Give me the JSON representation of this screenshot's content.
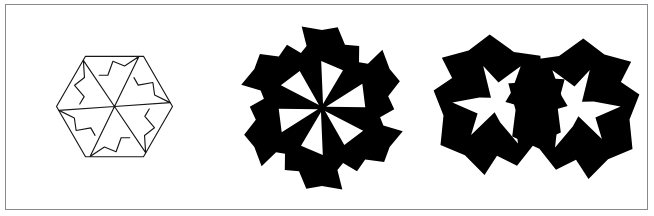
{
  "plate": {
    "width": 654,
    "height": 216,
    "background_color": "#ffffff",
    "border_color": "#8a8a8e",
    "ink_color": "#000000",
    "outline_color": "#171717",
    "frame": {
      "x": 5,
      "y": 4,
      "width": 643,
      "height": 206
    }
  },
  "figures": [
    {
      "id": "figure-1",
      "name": "hexagon-pinwheel-outline",
      "style": "outline",
      "symmetry_order": 6,
      "center": {
        "x": 114.5,
        "y": 106.5
      },
      "radius": 58,
      "rotation_deg": 0,
      "description": "Regular hexagon with an inscribed six-fold pinwheel drawn in thin black outline on white",
      "hexagon_vertices": [
        {
          "x": 172.5,
          "y": 106.5
        },
        {
          "x": 143.5,
          "y": 156.7
        },
        {
          "x": 85.5,
          "y": 156.7
        },
        {
          "x": 56.5,
          "y": 106.5
        },
        {
          "x": 85.5,
          "y": 56.3
        },
        {
          "x": 143.5,
          "y": 56.3
        }
      ],
      "blade_profile": [
        {
          "r": 0.0,
          "a": 0.0
        },
        {
          "r": 0.96,
          "a": 56.0
        },
        {
          "r": 0.72,
          "a": 44.0
        },
        {
          "r": 0.78,
          "a": 28.0
        },
        {
          "r": 0.55,
          "a": 18.0
        },
        {
          "r": 0.6,
          "a": 4.0
        }
      ]
    },
    {
      "id": "figure-2",
      "name": "six-blade-solid-pinwheel",
      "style": "solid",
      "symmetry_order": 6,
      "center": {
        "x": 322.0,
        "y": 108.0
      },
      "radius": 84,
      "rotation_deg": 14,
      "description": "Six-fold solid black pinwheel rosette with white triangular wedges radiating from the centre",
      "outer_profile": [
        {
          "r": 1.0,
          "a": 2.0
        },
        {
          "r": 0.93,
          "a": 16.0
        },
        {
          "r": 0.98,
          "a": 27.0
        },
        {
          "r": 0.8,
          "a": 36.0
        },
        {
          "r": 0.86,
          "a": 47.0
        },
        {
          "r": 0.7,
          "a": 55.0
        },
        {
          "r": 0.76,
          "a": 62.0
        }
      ],
      "wedge_half_angle_deg": 15,
      "wedge_inner_radius": 0.05,
      "wedge_outer_radius": 0.56
    },
    {
      "id": "figure-3-left",
      "name": "three-blade-solid-pinwheel-left",
      "style": "solid",
      "symmetry_order": 3,
      "center": {
        "x": 497.0,
        "y": 104.0
      },
      "radius": 72,
      "rotation_deg": 96,
      "mirrored": false,
      "description": "Three-fold solid black pinwheel with a white star-shaped void at its core",
      "outer_profile": [
        {
          "r": 1.0,
          "a": 4.0
        },
        {
          "r": 0.84,
          "a": 26.0
        },
        {
          "r": 0.97,
          "a": 48.0
        },
        {
          "r": 0.76,
          "a": 72.0
        },
        {
          "r": 0.9,
          "a": 96.0
        },
        {
          "r": 0.72,
          "a": 114.0
        }
      ],
      "inner_profile": [
        {
          "r": 0.12,
          "a": 10.0
        },
        {
          "r": 0.56,
          "a": 34.0
        },
        {
          "r": 0.3,
          "a": 58.0
        },
        {
          "r": 0.62,
          "a": 86.0
        },
        {
          "r": 0.26,
          "a": 104.0
        }
      ]
    },
    {
      "id": "figure-3-right",
      "name": "three-blade-solid-pinwheel-right",
      "style": "solid",
      "symmetry_order": 3,
      "center": {
        "x": 576.0,
        "y": 108.0
      },
      "radius": 72,
      "rotation_deg": 96,
      "mirrored": true,
      "description": "Mirror image of the left three-fold pinwheel, joined to it along a vertical seam",
      "outer_profile": [
        {
          "r": 1.0,
          "a": 4.0
        },
        {
          "r": 0.84,
          "a": 26.0
        },
        {
          "r": 0.97,
          "a": 48.0
        },
        {
          "r": 0.76,
          "a": 72.0
        },
        {
          "r": 0.9,
          "a": 96.0
        },
        {
          "r": 0.72,
          "a": 114.0
        }
      ],
      "inner_profile": [
        {
          "r": 0.12,
          "a": 10.0
        },
        {
          "r": 0.56,
          "a": 34.0
        },
        {
          "r": 0.3,
          "a": 58.0
        },
        {
          "r": 0.62,
          "a": 86.0
        },
        {
          "r": 0.26,
          "a": 104.0
        }
      ]
    }
  ]
}
